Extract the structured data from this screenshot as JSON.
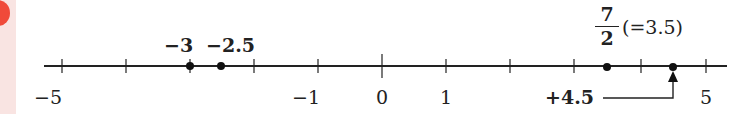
{
  "diagram": {
    "type": "number-line",
    "range": [
      -5,
      5
    ],
    "ticks": [
      -5,
      -4,
      -3,
      -2,
      -1,
      0,
      1,
      2,
      3,
      4,
      5
    ],
    "tick_labels": [
      {
        "value": -5,
        "text": "−5"
      },
      {
        "value": -1,
        "text": "−1"
      },
      {
        "value": 0,
        "text": "0"
      },
      {
        "value": 1,
        "text": "1"
      },
      {
        "value": 5,
        "text": "5"
      }
    ],
    "points": [
      {
        "value": -3,
        "label": "−3"
      },
      {
        "value": -2.5,
        "label": "−2.5"
      },
      {
        "value": 3.5,
        "label_num": "7",
        "label_den": "2",
        "label_note": "(=3.5)"
      },
      {
        "value": 4.5
      }
    ],
    "annotation": {
      "text": "+4.5",
      "points_to": 4.5
    }
  },
  "colors": {
    "line": "#222222",
    "badge": "#f04a3a",
    "sidebar": "#f9e4e2"
  }
}
